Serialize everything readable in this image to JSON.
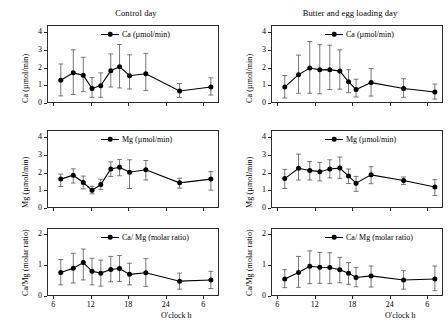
{
  "figure": {
    "columns": [
      {
        "id": "control",
        "title": "Control day"
      },
      {
        "id": "loading",
        "title": "Butter and egg loading day"
      }
    ],
    "xaxis": {
      "title": "O'clock h",
      "ticks": [
        6,
        12,
        18,
        24,
        6
      ],
      "tick_values": [
        6,
        12,
        18,
        24,
        30
      ],
      "range": [
        5,
        32.5
      ]
    }
  },
  "chart_data": [
    {
      "id": "ca-control",
      "type": "line",
      "title": "Control day",
      "series_name": "Ca (µmol/min)",
      "ylabel": "Ca (µmol/min)",
      "xlabel": "O'clock h",
      "ylim": [
        0,
        4.4
      ],
      "yticks": [
        0,
        1,
        2,
        3,
        4
      ],
      "xlim": [
        5,
        32.5
      ],
      "xticks": [
        6,
        12,
        18,
        24,
        30
      ],
      "xticklabels": [
        "6",
        "12",
        "18",
        "24",
        "6"
      ],
      "grid": false,
      "legend_position": "top-right",
      "x": [
        7.2,
        9.2,
        10.8,
        12.2,
        13.6,
        15.2,
        16.6,
        18.2,
        20.8,
        26.2,
        31.2
      ],
      "values": [
        1.28,
        1.7,
        1.56,
        0.82,
        0.98,
        1.82,
        2.05,
        1.54,
        1.65,
        0.68,
        0.9
      ],
      "err_low": [
        0.88,
        1.22,
        0.92,
        0.5,
        0.66,
        0.92,
        1.2,
        0.75,
        0.95,
        0.37,
        0.45
      ],
      "err_high": [
        0.92,
        1.3,
        1.02,
        0.62,
        0.72,
        0.95,
        1.25,
        1.18,
        1.15,
        0.42,
        0.52
      ]
    },
    {
      "id": "ca-loading",
      "type": "line",
      "title": "Butter and egg loading day",
      "series_name": "Ca (µmol/min)",
      "ylabel": "Ca (µmol/min)",
      "xlabel": "O'clock h",
      "ylim": [
        0,
        4.4
      ],
      "yticks": [
        0,
        1,
        2,
        3,
        4
      ],
      "xlim": [
        5,
        32.5
      ],
      "xticks": [
        6,
        12,
        18,
        24,
        30
      ],
      "xticklabels": [
        "6",
        "12",
        "18",
        "24",
        "6"
      ],
      "grid": false,
      "legend_position": "top-right",
      "x": [
        7.2,
        9.4,
        11.2,
        12.8,
        14.4,
        16.0,
        17.4,
        18.6,
        21.0,
        26.2,
        31.2
      ],
      "values": [
        0.9,
        1.6,
        1.97,
        1.87,
        1.88,
        1.8,
        1.2,
        0.76,
        1.15,
        0.82,
        0.62
      ],
      "err_low": [
        0.62,
        1.05,
        1.42,
        1.35,
        1.12,
        1.02,
        0.62,
        0.42,
        0.76,
        0.5,
        0.4
      ],
      "err_high": [
        0.65,
        1.1,
        1.5,
        1.42,
        1.38,
        1.2,
        0.68,
        0.58,
        0.8,
        0.55,
        0.45
      ]
    },
    {
      "id": "mg-control",
      "type": "line",
      "title": "Control day",
      "series_name": "Mg (µmol/min)",
      "ylabel": "Mg (µmol/min)",
      "xlabel": "O'clock h",
      "ylim": [
        0,
        4.4
      ],
      "yticks": [
        0,
        1,
        2,
        3,
        4
      ],
      "xlim": [
        5,
        32.5
      ],
      "xticks": [
        6,
        12,
        18,
        24,
        30
      ],
      "xticklabels": [
        "6",
        "12",
        "18",
        "24",
        "6"
      ],
      "grid": false,
      "legend_position": "top-right",
      "x": [
        7.2,
        9.2,
        10.8,
        12.2,
        13.6,
        15.2,
        16.6,
        18.2,
        20.8,
        26.2,
        31.2
      ],
      "values": [
        1.63,
        1.85,
        1.44,
        1.0,
        1.32,
        2.2,
        2.3,
        2.02,
        2.16,
        1.42,
        1.63
      ],
      "err_low": [
        0.42,
        0.44,
        0.36,
        0.2,
        0.28,
        0.42,
        0.48,
        0.92,
        0.58,
        0.3,
        0.62
      ],
      "err_high": [
        0.28,
        0.36,
        0.36,
        0.22,
        0.3,
        0.4,
        0.44,
        0.7,
        0.52,
        0.26,
        0.42
      ]
    },
    {
      "id": "mg-loading",
      "type": "line",
      "title": "Butter and egg loading day",
      "series_name": "Mg (µmol/min)",
      "ylabel": "Mg (µmol/min)",
      "xlabel": "O'clock h",
      "ylim": [
        0,
        4.4
      ],
      "yticks": [
        0,
        1,
        2,
        3,
        4
      ],
      "xlim": [
        5,
        32.5
      ],
      "xticks": [
        6,
        12,
        18,
        24,
        30
      ],
      "xticklabels": [
        "6",
        "12",
        "18",
        "24",
        "6"
      ],
      "grid": false,
      "legend_position": "top-right",
      "x": [
        7.2,
        9.4,
        11.2,
        12.8,
        14.4,
        16.0,
        17.4,
        18.6,
        21.0,
        26.2,
        31.2
      ],
      "values": [
        1.66,
        2.24,
        2.12,
        2.05,
        2.2,
        2.25,
        1.8,
        1.4,
        1.87,
        1.55,
        1.18
      ],
      "err_low": [
        0.56,
        0.66,
        0.54,
        0.52,
        0.5,
        0.58,
        0.42,
        0.46,
        0.5,
        0.22,
        0.48
      ],
      "err_high": [
        0.52,
        0.8,
        0.5,
        0.52,
        0.52,
        0.62,
        0.4,
        0.38,
        0.46,
        0.2,
        0.42
      ]
    },
    {
      "id": "camg-control",
      "type": "line",
      "title": "Control day",
      "series_name": "Ca/ Mg (molar ratio)",
      "ylabel": "Ca/Mg (molar ratio)",
      "xlabel": "O'clock h",
      "ylim": [
        0,
        2.2
      ],
      "yticks": [
        0,
        1,
        2
      ],
      "xlim": [
        5,
        32.5
      ],
      "xticks": [
        6,
        12,
        18,
        24,
        30
      ],
      "xticklabels": [
        "6",
        "12",
        "18",
        "24",
        "6"
      ],
      "grid": false,
      "legend_position": "top-right",
      "x": [
        7.2,
        9.2,
        10.8,
        12.2,
        13.6,
        15.2,
        16.6,
        18.2,
        20.8,
        26.2,
        31.2
      ],
      "values": [
        0.76,
        0.9,
        1.08,
        0.8,
        0.74,
        0.86,
        0.89,
        0.7,
        0.75,
        0.48,
        0.52
      ],
      "err_low": [
        0.4,
        0.48,
        0.56,
        0.44,
        0.42,
        0.4,
        0.42,
        0.34,
        0.44,
        0.26,
        0.28
      ],
      "err_high": [
        0.42,
        0.48,
        0.44,
        0.42,
        0.42,
        0.42,
        0.42,
        0.36,
        0.46,
        0.26,
        0.28
      ]
    },
    {
      "id": "camg-loading",
      "type": "line",
      "title": "Butter and egg loading day",
      "series_name": "Ca/ Mg (molar ratio)",
      "ylabel": "Ca/Mg (molar ratio)",
      "xlabel": "O'clock h",
      "ylim": [
        0,
        2.2
      ],
      "yticks": [
        0,
        1,
        2
      ],
      "xlim": [
        5,
        32.5
      ],
      "xticks": [
        6,
        12,
        18,
        24,
        30
      ],
      "xticklabels": [
        "6",
        "12",
        "18",
        "24",
        "6"
      ],
      "grid": false,
      "legend_position": "top-right",
      "x": [
        7.2,
        9.4,
        11.2,
        12.8,
        14.4,
        16.0,
        17.4,
        18.6,
        21.0,
        26.2,
        31.2
      ],
      "values": [
        0.55,
        0.76,
        0.96,
        0.93,
        0.92,
        0.85,
        0.74,
        0.6,
        0.65,
        0.52,
        0.55
      ],
      "err_low": [
        0.28,
        0.48,
        0.56,
        0.52,
        0.52,
        0.42,
        0.36,
        0.3,
        0.36,
        0.3,
        0.38
      ],
      "err_high": [
        0.3,
        0.52,
        0.5,
        0.48,
        0.48,
        0.4,
        0.34,
        0.32,
        0.32,
        0.3,
        0.42
      ]
    }
  ],
  "style": {
    "line_color": "#000000",
    "marker_color": "#000000",
    "error_color": "#555555",
    "axis_color": "#2b2b2b"
  }
}
